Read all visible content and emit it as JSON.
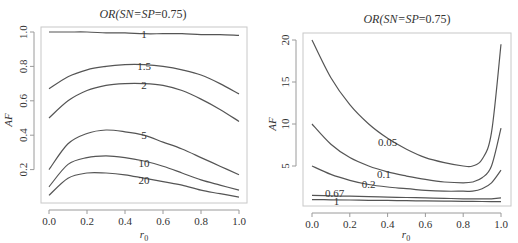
{
  "chart_data": [
    {
      "type": "line",
      "title": "OR(SN=SP=0.75)",
      "title_parts": {
        "italic": "OR(SN=SP",
        "plain": "=0.75)"
      },
      "xlabel": "r0",
      "ylabel": "AF",
      "xlim": [
        0,
        1
      ],
      "ylim": [
        0.02,
        1.02
      ],
      "xticks": [
        "0.0",
        "0.2",
        "0.4",
        "0.6",
        "0.8",
        "1.0"
      ],
      "yticks": [
        "0.2",
        "0.4",
        "0.6",
        "0.8",
        "1.0"
      ],
      "grid": false,
      "x": [
        0.0,
        0.1,
        0.2,
        0.3,
        0.4,
        0.5,
        0.6,
        0.7,
        0.8,
        0.9,
        1.0
      ],
      "series": [
        {
          "name": "1",
          "values": [
            1.0,
            1.0,
            1.0,
            0.995,
            0.995,
            0.99,
            0.99,
            0.99,
            0.985,
            0.985,
            0.98
          ]
        },
        {
          "name": "1.5",
          "values": [
            0.67,
            0.74,
            0.78,
            0.8,
            0.81,
            0.81,
            0.8,
            0.78,
            0.75,
            0.7,
            0.64
          ]
        },
        {
          "name": "2",
          "values": [
            0.5,
            0.6,
            0.66,
            0.69,
            0.7,
            0.7,
            0.69,
            0.66,
            0.61,
            0.55,
            0.48
          ]
        },
        {
          "name": "5",
          "values": [
            0.2,
            0.35,
            0.41,
            0.43,
            0.42,
            0.4,
            0.36,
            0.32,
            0.27,
            0.22,
            0.17
          ]
        },
        {
          "name": "10",
          "values": [
            0.1,
            0.23,
            0.27,
            0.28,
            0.27,
            0.25,
            0.22,
            0.18,
            0.14,
            0.11,
            0.08
          ]
        },
        {
          "name": "20",
          "values": [
            0.05,
            0.15,
            0.18,
            0.18,
            0.17,
            0.15,
            0.13,
            0.11,
            0.08,
            0.06,
            0.04
          ]
        }
      ],
      "curve_labels": [
        {
          "text": "1",
          "x": 0.5,
          "y": 0.99
        },
        {
          "text": "1.5",
          "x": 0.5,
          "y": 0.8
        },
        {
          "text": "2",
          "x": 0.5,
          "y": 0.69
        },
        {
          "text": "5",
          "x": 0.5,
          "y": 0.4
        },
        {
          "text": "10",
          "x": 0.5,
          "y": 0.24
        },
        {
          "text": "20",
          "x": 0.5,
          "y": 0.14
        }
      ]
    },
    {
      "type": "line",
      "title": "OR(SN=SP=0.75)",
      "title_parts": {
        "italic": "OR(SN=SP",
        "plain": "=0.75)"
      },
      "xlabel": "r0",
      "ylabel": "AF",
      "xlim": [
        0,
        1
      ],
      "ylim": [
        0,
        20.5
      ],
      "xticks": [
        "0.0",
        "0.2",
        "0.4",
        "0.6",
        "0.8",
        "1.0"
      ],
      "yticks": [
        "5",
        "10",
        "15",
        "20"
      ],
      "grid": false,
      "x": [
        0.0,
        0.1,
        0.2,
        0.3,
        0.4,
        0.5,
        0.6,
        0.7,
        0.8,
        0.85,
        0.9,
        0.95,
        1.0
      ],
      "series": [
        {
          "name": "0.05",
          "values": [
            20.0,
            15.5,
            12.3,
            10.0,
            8.3,
            7.0,
            6.0,
            5.4,
            5.0,
            5.0,
            5.8,
            9.0,
            19.5
          ]
        },
        {
          "name": "0.1",
          "values": [
            10.0,
            7.6,
            6.0,
            5.0,
            4.3,
            3.8,
            3.4,
            3.1,
            3.0,
            3.1,
            3.6,
            5.0,
            9.5
          ]
        },
        {
          "name": "0.2",
          "values": [
            5.0,
            4.0,
            3.3,
            2.8,
            2.5,
            2.3,
            2.1,
            2.0,
            2.0,
            2.0,
            2.3,
            3.0,
            4.5
          ]
        },
        {
          "name": "0.67",
          "values": [
            1.5,
            1.45,
            1.4,
            1.35,
            1.3,
            1.25,
            1.2,
            1.15,
            1.1,
            1.1,
            1.1,
            1.1,
            1.2
          ]
        },
        {
          "name": "1",
          "values": [
            1.0,
            0.98,
            0.95,
            0.92,
            0.9,
            0.87,
            0.85,
            0.82,
            0.8,
            0.78,
            0.77,
            0.76,
            0.75
          ]
        }
      ],
      "curve_labels": [
        {
          "text": "0.05",
          "x": 0.4,
          "y": 7.8
        },
        {
          "text": "0.1",
          "x": 0.38,
          "y": 4.0
        },
        {
          "text": "0.2",
          "x": 0.3,
          "y": 2.8
        },
        {
          "text": "0.67",
          "x": 0.12,
          "y": 1.8
        },
        {
          "text": "1",
          "x": 0.13,
          "y": 0.85
        }
      ]
    }
  ]
}
